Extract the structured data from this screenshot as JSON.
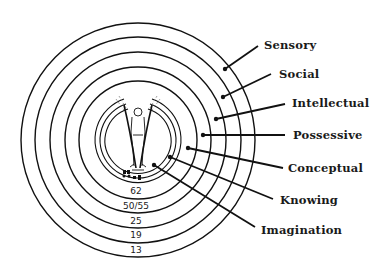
{
  "diagram": {
    "type": "concentric-circles",
    "center": [
      138,
      140
    ],
    "colors": {
      "line": "#111111",
      "text": "#1a1a1a",
      "background": "#ffffff"
    },
    "rings": [
      {
        "label": "Sensory",
        "age": "13",
        "radius": 117
      },
      {
        "label": "Social",
        "age": "19",
        "radius": 103
      },
      {
        "label": "Intellectual",
        "age": "25",
        "radius": 88
      },
      {
        "label": "Possessive",
        "age": "50/55",
        "radius": 73
      },
      {
        "label": "Conceptual",
        "age": "62",
        "radius": 59
      }
    ],
    "inner_rings": [
      {
        "label": "Knowing",
        "radius": 43
      },
      {
        "label": "Imagination",
        "radius": 38
      }
    ],
    "labels": [
      {
        "text": "Sensory"
      },
      {
        "text": "Social"
      },
      {
        "text": "Intellectual"
      },
      {
        "text": "Possessive"
      },
      {
        "text": "Conceptual"
      },
      {
        "text": "Knowing"
      },
      {
        "text": "Imagination"
      }
    ],
    "ages": [
      {
        "text": "62"
      },
      {
        "text": "50/55"
      },
      {
        "text": "25"
      },
      {
        "text": "19"
      },
      {
        "text": "13"
      }
    ],
    "center_figure": "human-figure-icon"
  }
}
